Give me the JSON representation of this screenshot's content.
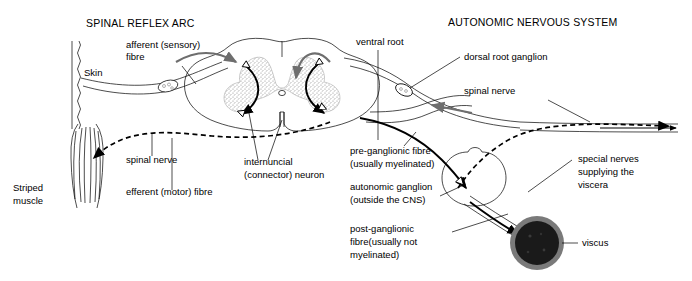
{
  "figure": {
    "title_left": "SPINAL REFLEX  ARC",
    "title_right": "AUTONOMIC  NERVOUS SYSTEM"
  },
  "labels": {
    "afferent": "afferent (sensory)",
    "afferent_line2": "fibre",
    "skin": "Skin",
    "spinal_nerve_left": "spinal nerve",
    "striped_muscle_line1": "Striped",
    "striped_muscle_line2": "muscle",
    "efferent": "efferent (motor) fibre",
    "internuncial_line1": "internuncial",
    "internuncial_line2": "(connector) neuron",
    "ventral_root": "ventral root",
    "dorsal_root_ganglion": "dorsal root ganglion",
    "spinal_nerve_right": "spinal nerve",
    "pre_ganglionic_line1": "pre-ganglionic fibre",
    "pre_ganglionic_line2": "(usually myelinated)",
    "autonomic_ganglion_line1": "autonomic ganglion",
    "autonomic_ganglion_line2": "(outside the CNS)",
    "post_ganglionic_line1": "post-ganglionic",
    "post_ganglionic_line2": "fibre(usually not",
    "post_ganglionic_line3": "myelinated)",
    "special_nerves_line1": "special nerves",
    "special_nerves_line2": "supplying the",
    "special_nerves_line3": "viscera",
    "viscus": "viscus"
  },
  "colors": {
    "ink": "#000000",
    "grey_matter_stipple": "#9a9a9a",
    "nerve_sheath": "#8c8c8c",
    "viscus_core": "#1a1a1a",
    "viscus_ring": "#7a7a7a",
    "background": "#ffffff"
  }
}
